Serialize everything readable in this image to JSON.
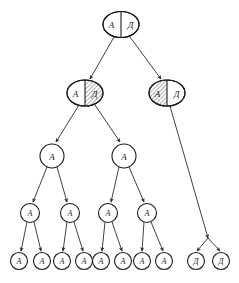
{
  "figure": {
    "symbols": {
      "nonterminal_a": "A",
      "nonterminal_d": "Д"
    },
    "colors": {
      "stroke": "#1a1a1a",
      "edge": "#2b2b2b",
      "background": "#ffffff",
      "hatch": "#1a1a1a"
    }
  },
  "nodes": [
    {
      "id": "root",
      "kind": "split-oval",
      "level": 1,
      "cx": 121,
      "cy": 24.5,
      "rx": 18,
      "ry": 13,
      "left_label": "A",
      "right_label": "Д",
      "left_hatched": false,
      "right_hatched": false
    },
    {
      "id": "l2-left",
      "kind": "split-oval",
      "level": 2,
      "cx": 85,
      "cy": 93,
      "rx": 18,
      "ry": 13,
      "left_label": "A",
      "right_label": "Д",
      "left_hatched": false,
      "right_hatched": true
    },
    {
      "id": "l2-right",
      "kind": "split-oval",
      "level": 2,
      "cx": 167,
      "cy": 93,
      "rx": 18,
      "ry": 13,
      "left_label": "A",
      "right_label": "Д",
      "left_hatched": true,
      "right_hatched": false
    },
    {
      "id": "l3-left",
      "kind": "circle",
      "level": 3,
      "cx": 52,
      "cy": 156,
      "r": 12,
      "label": "A"
    },
    {
      "id": "l3-right",
      "kind": "circle",
      "level": 3,
      "cx": 124,
      "cy": 156,
      "r": 12,
      "label": "A"
    },
    {
      "id": "l4-1",
      "kind": "circle",
      "level": 4,
      "cx": 30,
      "cy": 213,
      "r": 9.5,
      "label": "A"
    },
    {
      "id": "l4-2",
      "kind": "circle",
      "level": 4,
      "cx": 70,
      "cy": 213,
      "r": 9.5,
      "label": "A"
    },
    {
      "id": "l4-3",
      "kind": "circle",
      "level": 4,
      "cx": 108,
      "cy": 213,
      "r": 9.5,
      "label": "A"
    },
    {
      "id": "l4-4",
      "kind": "circle",
      "level": 4,
      "cx": 147,
      "cy": 213,
      "r": 9.5,
      "label": "A"
    },
    {
      "id": "l5-1",
      "kind": "circle",
      "level": 5,
      "cx": 19,
      "cy": 261,
      "r": 8.5,
      "label": "A"
    },
    {
      "id": "l5-2",
      "kind": "circle",
      "level": 5,
      "cx": 42,
      "cy": 261,
      "r": 8.5,
      "label": "A"
    },
    {
      "id": "l5-3",
      "kind": "circle",
      "level": 5,
      "cx": 62,
      "cy": 261,
      "r": 8.5,
      "label": "A"
    },
    {
      "id": "l5-4",
      "kind": "circle",
      "level": 5,
      "cx": 84,
      "cy": 261,
      "r": 8.5,
      "label": "A"
    },
    {
      "id": "l5-5",
      "kind": "circle",
      "level": 5,
      "cx": 101,
      "cy": 261,
      "r": 8.5,
      "label": "A"
    },
    {
      "id": "l5-6",
      "kind": "circle",
      "level": 5,
      "cx": 123,
      "cy": 261,
      "r": 8.5,
      "label": "A"
    },
    {
      "id": "l5-7",
      "kind": "circle",
      "level": 5,
      "cx": 142,
      "cy": 261,
      "r": 8.5,
      "label": "A"
    },
    {
      "id": "l5-8",
      "kind": "circle",
      "level": 5,
      "cx": 164,
      "cy": 261,
      "r": 8.5,
      "label": "A"
    },
    {
      "id": "l5-d1",
      "kind": "circle",
      "level": 5,
      "cx": 196,
      "cy": 261,
      "r": 8.5,
      "label": "Д"
    },
    {
      "id": "l5-d2",
      "kind": "circle",
      "level": 5,
      "cx": 221,
      "cy": 261,
      "r": 8.5,
      "label": "Д"
    }
  ],
  "edges": [
    {
      "id": "e-root-l2left",
      "from": "root",
      "to": "l2-left",
      "x1": 114,
      "y1": 37,
      "x2": 90,
      "y2": 79
    },
    {
      "id": "e-root-l2right",
      "from": "root",
      "to": "l2-right",
      "x1": 130,
      "y1": 37,
      "x2": 161,
      "y2": 79
    },
    {
      "id": "e-l2left-l3left",
      "from": "l2-left",
      "to": "l3-left",
      "x1": 79,
      "y1": 105,
      "x2": 56,
      "y2": 142
    },
    {
      "id": "e-l2left-l3right",
      "from": "l2-left",
      "to": "l3-right",
      "x1": 95,
      "y1": 105,
      "x2": 120,
      "y2": 142
    },
    {
      "id": "e-l2right-branch",
      "from": "l2-right",
      "to": "branch",
      "x1": 170,
      "y1": 106,
      "x2": 208,
      "y2": 238
    },
    {
      "id": "e-branch-d1",
      "from": "branch",
      "to": "l5-d1",
      "x1": 208,
      "y1": 238,
      "x2": 197,
      "y2": 251
    },
    {
      "id": "e-branch-d2",
      "from": "branch",
      "to": "l5-d2",
      "x1": 208,
      "y1": 238,
      "x2": 220,
      "y2": 251
    },
    {
      "id": "e-l3left-l4-1",
      "from": "l3-left",
      "to": "l4-1",
      "x1": 47,
      "y1": 167,
      "x2": 33,
      "y2": 202
    },
    {
      "id": "e-l3left-l4-2",
      "from": "l3-left",
      "to": "l4-2",
      "x1": 57,
      "y1": 167,
      "x2": 67,
      "y2": 202
    },
    {
      "id": "e-l3right-l4-3",
      "from": "l3-right",
      "to": "l4-3",
      "x1": 119,
      "y1": 167,
      "x2": 111,
      "y2": 202
    },
    {
      "id": "e-l3right-l4-4",
      "from": "l3-right",
      "to": "l4-4",
      "x1": 129,
      "y1": 167,
      "x2": 144,
      "y2": 202
    },
    {
      "id": "e-l4-1-l5-1",
      "from": "l4-1",
      "to": "l5-1",
      "x1": 27,
      "y1": 222,
      "x2": 21,
      "y2": 251
    },
    {
      "id": "e-l4-1-l5-2",
      "from": "l4-1",
      "to": "l5-2",
      "x1": 34,
      "y1": 222,
      "x2": 41,
      "y2": 251
    },
    {
      "id": "e-l4-2-l5-3",
      "from": "l4-2",
      "to": "l5-3",
      "x1": 67,
      "y1": 222,
      "x2": 63,
      "y2": 251
    },
    {
      "id": "e-l4-2-l5-4",
      "from": "l4-2",
      "to": "l5-4",
      "x1": 74,
      "y1": 222,
      "x2": 83,
      "y2": 251
    },
    {
      "id": "e-l4-3-l5-5",
      "from": "l4-3",
      "to": "l5-5",
      "x1": 105,
      "y1": 222,
      "x2": 102,
      "y2": 251
    },
    {
      "id": "e-l4-3-l5-6",
      "from": "l4-3",
      "to": "l5-6",
      "x1": 112,
      "y1": 222,
      "x2": 122,
      "y2": 251
    },
    {
      "id": "e-l4-4-l5-7",
      "from": "l4-4",
      "to": "l5-7",
      "x1": 144,
      "y1": 222,
      "x2": 142,
      "y2": 251
    },
    {
      "id": "e-l4-4-l5-8",
      "from": "l4-4",
      "to": "l5-8",
      "x1": 151,
      "y1": 222,
      "x2": 163,
      "y2": 251
    }
  ]
}
